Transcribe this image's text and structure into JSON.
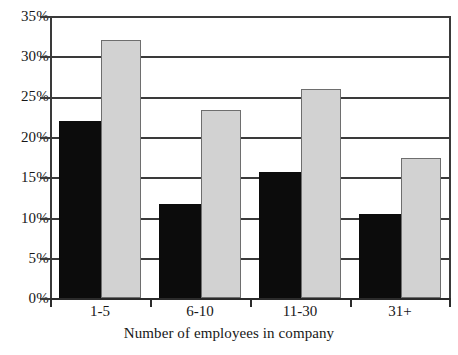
{
  "chart_data": {
    "type": "bar",
    "title": "",
    "subtitle": "",
    "xlabel": "Number of employees in company",
    "ylabel": "",
    "categories": [
      "1-5",
      "6-10",
      "11-30",
      "31+"
    ],
    "series": [
      {
        "name": "dark-series",
        "color": "#0c0c0c",
        "values": [
          22.0,
          11.7,
          15.6,
          10.4
        ]
      },
      {
        "name": "light-series",
        "color": "#d2d2d2",
        "values": [
          32.0,
          23.3,
          26.0,
          17.4
        ]
      }
    ],
    "ylim": [
      0,
      35
    ],
    "ytick_values": [
      0,
      5,
      10,
      15,
      20,
      25,
      30,
      35
    ],
    "ytick_labels": [
      "0%",
      "5%",
      "10%",
      "15%",
      "20%",
      "25%",
      "30%",
      "35%"
    ],
    "grid": true,
    "grid_axis": "y",
    "legend": "none",
    "legend_position": "none",
    "annotations": []
  },
  "axis": {
    "y": {
      "labels": [
        "35%",
        "30%",
        "25%",
        "20%",
        "15%",
        "10%",
        "5%",
        "0%"
      ]
    },
    "x": {
      "labels": [
        "1-5",
        "6-10",
        "11-30",
        "31+"
      ],
      "title": "Number of employees in company"
    }
  },
  "colors": {
    "dark_bar": "#0c0c0c",
    "light_bar": "#d2d2d2",
    "light_bar_border": "#6e6e6e",
    "axis": "#2b2b2b",
    "grid": "#3a3a3a",
    "background": "#ffffff",
    "text": "#171717"
  }
}
